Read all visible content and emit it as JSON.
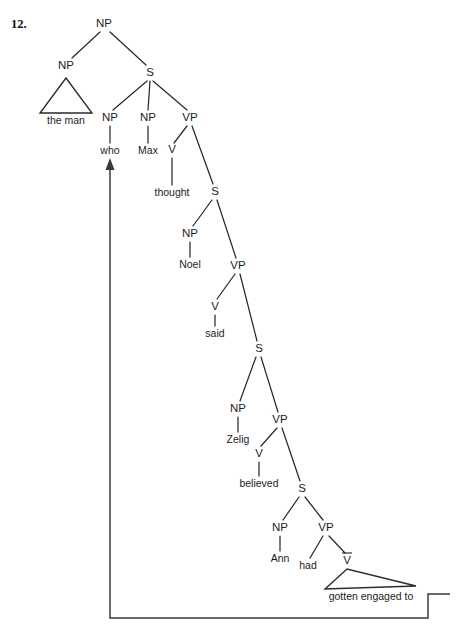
{
  "exercise": {
    "number": "12."
  },
  "diagram": {
    "type": "syntax-tree",
    "sentence": "the man who Max thought Noel said Zelig believed Ann had gotten engaged to",
    "nodes": [
      {
        "id": "np-root",
        "label": "NP",
        "x": 104,
        "y": 24,
        "kind": "nonterminal"
      },
      {
        "id": "np-subj",
        "label": "NP",
        "x": 66,
        "y": 66,
        "kind": "nonterminal"
      },
      {
        "id": "s1",
        "label": "S",
        "x": 150,
        "y": 73,
        "kind": "nonterminal"
      },
      {
        "id": "np-who",
        "label": "NP",
        "x": 110,
        "y": 118,
        "kind": "nonterminal"
      },
      {
        "id": "np-max",
        "label": "NP",
        "x": 148,
        "y": 118,
        "kind": "nonterminal"
      },
      {
        "id": "vp1",
        "label": "VP",
        "x": 190,
        "y": 118,
        "kind": "nonterminal"
      },
      {
        "id": "v-thought",
        "label": "V",
        "x": 172,
        "y": 150,
        "kind": "nonterminal"
      },
      {
        "id": "s2",
        "label": "S",
        "x": 215,
        "y": 192,
        "kind": "nonterminal"
      },
      {
        "id": "np-noel",
        "label": "NP",
        "x": 190,
        "y": 234,
        "kind": "nonterminal"
      },
      {
        "id": "vp2",
        "label": "VP",
        "x": 238,
        "y": 266,
        "kind": "nonterminal"
      },
      {
        "id": "v-said",
        "label": "V",
        "x": 215,
        "y": 307,
        "kind": "nonterminal"
      },
      {
        "id": "s3",
        "label": "S",
        "x": 259,
        "y": 349,
        "kind": "nonterminal"
      },
      {
        "id": "np-zelig",
        "label": "NP",
        "x": 238,
        "y": 409,
        "kind": "nonterminal"
      },
      {
        "id": "vp3",
        "label": "VP",
        "x": 280,
        "y": 420,
        "kind": "nonterminal"
      },
      {
        "id": "v-believed",
        "label": "V",
        "x": 259,
        "y": 454,
        "kind": "nonterminal"
      },
      {
        "id": "s4",
        "label": "S",
        "x": 302,
        "y": 489,
        "kind": "nonterminal"
      },
      {
        "id": "np-ann",
        "label": "NP",
        "x": 280,
        "y": 528,
        "kind": "nonterminal"
      },
      {
        "id": "vp4",
        "label": "VP",
        "x": 326,
        "y": 528,
        "kind": "nonterminal"
      },
      {
        "id": "vbar",
        "label": "V",
        "x": 347,
        "y": 561,
        "kind": "nonterminal-bar"
      }
    ],
    "terminals": [
      {
        "id": "t-theman",
        "label": "the man",
        "x": 66,
        "y": 121,
        "kind": "triangle-phrase"
      },
      {
        "id": "t-who",
        "label": "who",
        "x": 110,
        "y": 151,
        "kind": "word"
      },
      {
        "id": "t-max",
        "label": "Max",
        "x": 148,
        "y": 151,
        "kind": "word"
      },
      {
        "id": "t-thought",
        "label": "thought",
        "x": 172,
        "y": 193,
        "kind": "word"
      },
      {
        "id": "t-noel",
        "label": "Noel",
        "x": 190,
        "y": 265,
        "kind": "word"
      },
      {
        "id": "t-said",
        "label": "said",
        "x": 215,
        "y": 334,
        "kind": "word"
      },
      {
        "id": "t-zelig",
        "label": "Zelig",
        "x": 238,
        "y": 440,
        "kind": "word"
      },
      {
        "id": "t-believed",
        "label": "believed",
        "x": 259,
        "y": 484,
        "kind": "word"
      },
      {
        "id": "t-ann",
        "label": "Ann",
        "x": 280,
        "y": 559,
        "kind": "word"
      },
      {
        "id": "t-had",
        "label": "had",
        "x": 308,
        "y": 566,
        "kind": "word"
      },
      {
        "id": "t-gotten",
        "label": "gotten engaged to",
        "x": 371,
        "y": 597,
        "kind": "triangle-phrase"
      }
    ],
    "branches": [
      {
        "from": "np-root",
        "to": "np-subj"
      },
      {
        "from": "np-root",
        "to": "s1"
      },
      {
        "from": "s1",
        "to": "np-who"
      },
      {
        "from": "s1",
        "to": "np-max"
      },
      {
        "from": "s1",
        "to": "vp1"
      },
      {
        "from": "np-who",
        "to": "t-who"
      },
      {
        "from": "np-max",
        "to": "t-max"
      },
      {
        "from": "vp1",
        "to": "v-thought"
      },
      {
        "from": "vp1",
        "to": "s2"
      },
      {
        "from": "v-thought",
        "to": "t-thought"
      },
      {
        "from": "s2",
        "to": "np-noel"
      },
      {
        "from": "s2",
        "to": "vp2"
      },
      {
        "from": "np-noel",
        "to": "t-noel"
      },
      {
        "from": "vp2",
        "to": "v-said"
      },
      {
        "from": "vp2",
        "to": "s3"
      },
      {
        "from": "v-said",
        "to": "t-said"
      },
      {
        "from": "s3",
        "to": "np-zelig"
      },
      {
        "from": "s3",
        "to": "vp3"
      },
      {
        "from": "np-zelig",
        "to": "t-zelig"
      },
      {
        "from": "vp3",
        "to": "v-believed"
      },
      {
        "from": "vp3",
        "to": "s4"
      },
      {
        "from": "v-believed",
        "to": "t-believed"
      },
      {
        "from": "s4",
        "to": "np-ann"
      },
      {
        "from": "s4",
        "to": "vp4"
      },
      {
        "from": "np-ann",
        "to": "t-ann"
      },
      {
        "from": "vp4",
        "to": "t-had"
      },
      {
        "from": "vp4",
        "to": "vbar"
      }
    ],
    "movement": {
      "label": "wh-movement trace path",
      "from_terminal": "t-gotten",
      "to_node": "t-who",
      "arrowhead": "up"
    },
    "colors": {
      "line": "#2a2a2a",
      "trace": "#3a3a3a",
      "text": "#1c1c1c",
      "background": "#ffffff"
    }
  }
}
